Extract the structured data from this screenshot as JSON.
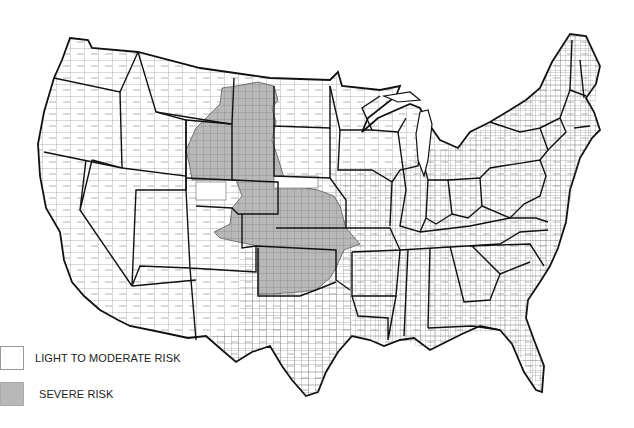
{
  "map": {
    "subject": "Contiguous United States counties",
    "colors": {
      "light": "#ffffff",
      "severe": "#b8b8b8",
      "state_border": "#111111",
      "county_border": "#444444"
    }
  },
  "legend": {
    "items": [
      {
        "label": "LIGHT TO MODERATE RISK",
        "color": "#ffffff"
      },
      {
        "label": "SEVERE RISK",
        "color": "#b8b8b8"
      }
    ]
  }
}
